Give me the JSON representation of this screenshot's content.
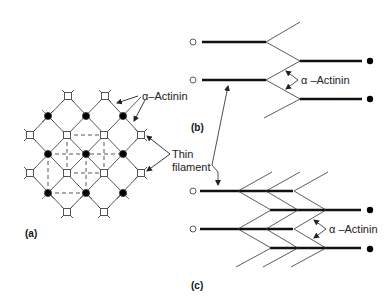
{
  "figure": {
    "panels": [
      {
        "id": "a",
        "label": "(a)",
        "description": "Square lattice of thin filaments and alpha-actinin cross-links (Z-disc cross-section)"
      },
      {
        "id": "b",
        "label": "(b)",
        "description": "Longitudinal view of single Z-disc zigzag"
      },
      {
        "id": "c",
        "label": "(c)",
        "description": "Longitudinal view of multi-layered Z-disc zigzag"
      }
    ],
    "annotations": {
      "alpha_actinin_a": "α–Actinin",
      "thin_filament_line1": "Thin",
      "thin_filament_line2": "filament",
      "alpha_actinin_b": "α –Actinin",
      "alpha_actinin_c": "α –Actinin"
    },
    "legend_symbols": {
      "open_circle": "thin filament end (one polarity)",
      "filled_circle": "thin filament end (opposite polarity)"
    },
    "colors": {
      "line": "#333333",
      "thick_line": "#111111",
      "dashed": "#444444",
      "background": "#ffffff"
    }
  }
}
